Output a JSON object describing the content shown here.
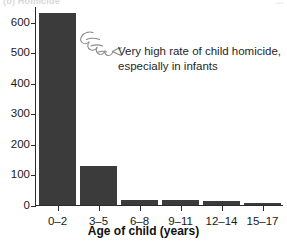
{
  "figure": {
    "top_crop_text_left": "(b) Homicide",
    "top_crop_text_right": "...",
    "background_color": "#ffffff"
  },
  "annotation": {
    "icon": "pointing-hand-icon",
    "line1": "Very high rate of child homicide,",
    "line2": "especially in infants",
    "text": "Very high rate of child homicide, especially in infants"
  },
  "chart_data": {
    "type": "bar",
    "title": "",
    "subtitle": "",
    "xlabel": "Age of child (years)",
    "ylabel": "",
    "categories": [
      "0–2",
      "3–5",
      "6–8",
      "9–11",
      "12–14",
      "15–17"
    ],
    "values": [
      630,
      128,
      15,
      15,
      13,
      8
    ],
    "ylim": [
      0,
      636
    ],
    "yticks": [
      0,
      100,
      200,
      300,
      400,
      500,
      600
    ],
    "ytick_labels": [
      "0",
      "100",
      "200",
      "300",
      "400",
      "500",
      "600"
    ],
    "grid": false,
    "legend": null,
    "bar_color": "#3b3b3b",
    "axis_color": "#2a2a2a",
    "annotations": [
      {
        "text": "Very high rate of child homicide, especially in infants",
        "points_to": "0–2"
      }
    ]
  }
}
